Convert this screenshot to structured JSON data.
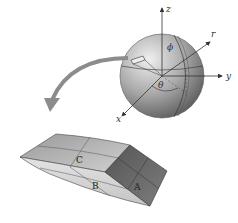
{
  "diagram": {
    "axes": {
      "z": "z",
      "y": "y",
      "x": "x",
      "r": "r"
    },
    "angles": {
      "phi": "ϕ",
      "theta": "θ"
    },
    "element_labels": {
      "a": "A",
      "b": "B",
      "c": "C"
    },
    "colors": {
      "sphere_light": "#e6e6e6",
      "sphere_dark": "#6f6f6f",
      "arrow": "#8c8c8c",
      "block_dark": "#6a6a6a",
      "block_light": "#dcdcdc"
    }
  }
}
